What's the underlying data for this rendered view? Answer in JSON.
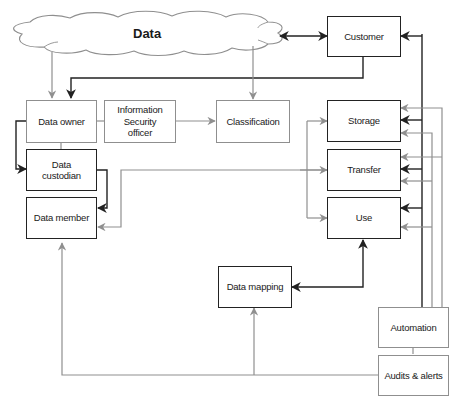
{
  "diagram": {
    "cloud": {
      "label": "Data"
    },
    "nodes": {
      "customer": "Customer",
      "data_owner": "Data owner",
      "info_security_officer": "Information Security officer",
      "classification": "Classification",
      "data_custodian": "Data custodian",
      "data_member": "Data member",
      "storage": "Storage",
      "transfer": "Transfer",
      "use": "Use",
      "data_mapping": "Data mapping",
      "automation": "Automation",
      "audits_alerts": "Audits & alerts"
    },
    "colors": {
      "dark_line": "#222222",
      "light_line": "#8f8f8f",
      "background": "#ffffff"
    },
    "edges": [
      {
        "from": "Data",
        "to": "Customer",
        "style": "dark",
        "bidirectional": true
      },
      {
        "from": "Customer",
        "to": "Data owner",
        "style": "dark"
      },
      {
        "from": "Data",
        "to": "Data owner",
        "style": "light"
      },
      {
        "from": "Data",
        "to": "Classification",
        "style": "light"
      },
      {
        "from": "Information Security officer",
        "to": "Classification",
        "style": "light"
      },
      {
        "from": "Data owner",
        "to": "Data custodian",
        "style": "dark"
      },
      {
        "from": "Data custodian",
        "to": "Data member",
        "style": "dark"
      },
      {
        "from": "Transfer",
        "to": "Data member",
        "style": "light"
      },
      {
        "from": "Data member",
        "to": "Storage",
        "style": "light"
      },
      {
        "from": "Data member",
        "to": "Transfer",
        "style": "light"
      },
      {
        "from": "Data member",
        "to": "Use",
        "style": "light"
      },
      {
        "from": "Use",
        "to": "Data mapping",
        "style": "dark",
        "bidirectional": true
      },
      {
        "from": "Audits & alerts",
        "to": "Data member",
        "style": "light"
      },
      {
        "from": "Audits & alerts",
        "to": "Data mapping",
        "style": "light"
      },
      {
        "from": "Automation",
        "to": "Customer",
        "style": "dark"
      },
      {
        "from": "Automation",
        "to": "Storage",
        "style": "dark"
      },
      {
        "from": "Automation",
        "to": "Transfer",
        "style": "dark"
      },
      {
        "from": "Automation",
        "to": "Use",
        "style": "dark"
      },
      {
        "from": "Automation",
        "to": "Storage",
        "style": "light"
      },
      {
        "from": "Automation",
        "to": "Transfer",
        "style": "light"
      },
      {
        "from": "Automation",
        "to": "Use",
        "style": "light"
      }
    ]
  }
}
